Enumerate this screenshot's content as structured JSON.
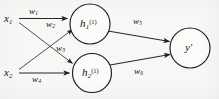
{
  "diagram": {
    "type": "neural-network",
    "background_color": "#f7f7f6",
    "stroke_color": "#262626",
    "node_fill_color": "#fbfbfa",
    "inputs": [
      {
        "id": "x1",
        "label": "x",
        "subscript": "1"
      },
      {
        "id": "x2",
        "label": "x",
        "subscript": "2"
      }
    ],
    "hidden_nodes": [
      {
        "id": "h1",
        "label": "h",
        "subscript": "1",
        "superscript": "(1)"
      },
      {
        "id": "h2",
        "label": "h",
        "subscript": "2",
        "superscript": "(1)"
      }
    ],
    "output_nodes": [
      {
        "id": "y",
        "label": "y",
        "prime": "′"
      }
    ],
    "weights": [
      {
        "id": "w1",
        "label": "w",
        "subscript": "1",
        "from": "x1",
        "to": "h1"
      },
      {
        "id": "w2",
        "label": "w",
        "subscript": "2",
        "from": "x1",
        "to": "h2"
      },
      {
        "id": "w3",
        "label": "w",
        "subscript": "3",
        "from": "x2",
        "to": "h1"
      },
      {
        "id": "w4",
        "label": "w",
        "subscript": "4",
        "from": "x2",
        "to": "h2"
      },
      {
        "id": "w5",
        "label": "w",
        "subscript": "5",
        "from": "h1",
        "to": "y"
      },
      {
        "id": "w6",
        "label": "w",
        "subscript": "6",
        "from": "h2",
        "to": "y"
      }
    ]
  }
}
